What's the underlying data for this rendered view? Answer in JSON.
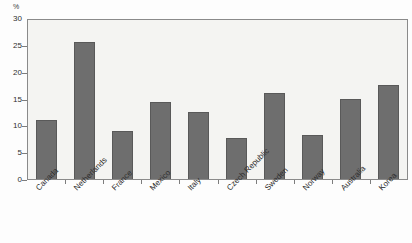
{
  "chart_data": {
    "type": "bar",
    "title": "",
    "xlabel": "",
    "ylabel": "%",
    "ylim": [
      0,
      30
    ],
    "yticks": [
      0,
      5,
      10,
      15,
      20,
      25,
      30
    ],
    "grid": false,
    "legend": "none",
    "bar_color": "#6e6e6e",
    "plot_background": "#f4f4f2",
    "categories": [
      "Canada",
      "Netherlands",
      "France",
      "Mexico",
      "Italy",
      "Czech Republic",
      "Sweden",
      "Norway",
      "Australia",
      "Korea"
    ],
    "values": [
      11.0,
      25.5,
      9.0,
      14.4,
      12.4,
      7.6,
      16.1,
      8.2,
      14.9,
      17.6
    ]
  },
  "axis": {
    "unit_label": "%",
    "tick_labels": [
      "30",
      "25",
      "20",
      "15",
      "10",
      "5",
      "0"
    ]
  }
}
